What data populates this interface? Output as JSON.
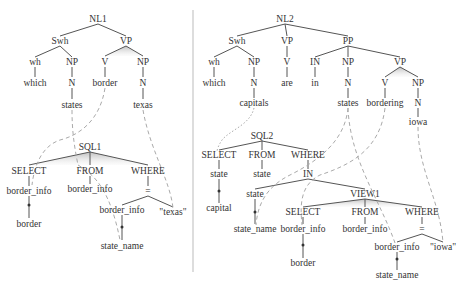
{
  "figure": {
    "left_panel": {
      "title": "NL1",
      "nodes": [
        {
          "id": "NL1",
          "label": "NL1",
          "x": 98,
          "y": 19
        },
        {
          "id": "Swh1",
          "label": "Swh",
          "x": 60,
          "y": 41
        },
        {
          "id": "VP1",
          "label": "VP",
          "x": 126,
          "y": 41
        },
        {
          "id": "wh1",
          "label": "wh",
          "x": 35,
          "y": 62
        },
        {
          "id": "NP1a",
          "label": "NP",
          "x": 72,
          "y": 62
        },
        {
          "id": "V1",
          "label": "V",
          "x": 105,
          "y": 62
        },
        {
          "id": "NP1b",
          "label": "NP",
          "x": 143,
          "y": 62
        },
        {
          "id": "which1",
          "label": "which",
          "x": 35,
          "y": 83
        },
        {
          "id": "N1a",
          "label": "N",
          "x": 72,
          "y": 83
        },
        {
          "id": "border1",
          "label": "border",
          "x": 105,
          "y": 83
        },
        {
          "id": "N1b",
          "label": "N",
          "x": 143,
          "y": 83
        },
        {
          "id": "states1",
          "label": "states",
          "x": 72,
          "y": 106
        },
        {
          "id": "texas1",
          "label": "texas",
          "x": 143,
          "y": 106
        },
        {
          "id": "SQL1",
          "label": "SQL1",
          "x": 88,
          "y": 147
        },
        {
          "id": "SELECT1",
          "label": "SELECT",
          "x": 29,
          "y": 171
        },
        {
          "id": "FROM1",
          "label": "FROM",
          "x": 90,
          "y": 171
        },
        {
          "id": "WHERE1",
          "label": "WHERE",
          "x": 148,
          "y": 171
        },
        {
          "id": "bi1a",
          "label": "border_info",
          "x": 29,
          "y": 192
        },
        {
          "id": "bi1b",
          "label": "border_info",
          "x": 90,
          "y": 190
        },
        {
          "id": "eq1",
          "label": "=",
          "x": 148,
          "y": 192
        },
        {
          "id": "border1s",
          "label": "border",
          "x": 29,
          "y": 225
        },
        {
          "id": "bi1c",
          "label": "border_info",
          "x": 126,
          "y": 211
        },
        {
          "id": "texasq1",
          "label": "\"texas\"",
          "x": 173,
          "y": 213
        },
        {
          "id": "sn1",
          "label": "state_name",
          "x": 122,
          "y": 247
        }
      ]
    },
    "right_panel": {
      "title": "NL2",
      "nodes": [
        {
          "id": "NL2",
          "label": "NL2",
          "x": 285,
          "y": 19
        },
        {
          "id": "Swh2",
          "label": "Swh",
          "x": 237,
          "y": 41
        },
        {
          "id": "VP2a",
          "label": "VP",
          "x": 287,
          "y": 41
        },
        {
          "id": "PP2",
          "label": "PP",
          "x": 348,
          "y": 41
        },
        {
          "id": "wh2",
          "label": "wh",
          "x": 214,
          "y": 62
        },
        {
          "id": "NP2a",
          "label": "NP",
          "x": 254,
          "y": 62
        },
        {
          "id": "V2a",
          "label": "V",
          "x": 287,
          "y": 62
        },
        {
          "id": "IN2",
          "label": "IN",
          "x": 315,
          "y": 62
        },
        {
          "id": "NP2b",
          "label": "NP",
          "x": 348,
          "y": 62
        },
        {
          "id": "VP2b",
          "label": "VP",
          "x": 400,
          "y": 62
        },
        {
          "id": "which2",
          "label": "which",
          "x": 214,
          "y": 83
        },
        {
          "id": "N2a",
          "label": "N",
          "x": 254,
          "y": 83
        },
        {
          "id": "are2",
          "label": "are",
          "x": 287,
          "y": 83
        },
        {
          "id": "in2",
          "label": "in",
          "x": 315,
          "y": 83
        },
        {
          "id": "N2b",
          "label": "N",
          "x": 348,
          "y": 83
        },
        {
          "id": "V2b",
          "label": "V",
          "x": 385,
          "y": 83
        },
        {
          "id": "NP2c",
          "label": "NP",
          "x": 418,
          "y": 83
        },
        {
          "id": "capitals2",
          "label": "capitals",
          "x": 254,
          "y": 104
        },
        {
          "id": "states2",
          "label": "states",
          "x": 348,
          "y": 104
        },
        {
          "id": "bordering2",
          "label": "bordering",
          "x": 385,
          "y": 104
        },
        {
          "id": "N2c",
          "label": "N",
          "x": 418,
          "y": 104
        },
        {
          "id": "iowa2",
          "label": "iowa",
          "x": 418,
          "y": 123
        },
        {
          "id": "SQL2",
          "label": "SQL2",
          "x": 262,
          "y": 136
        },
        {
          "id": "SELECT2",
          "label": "SELECT",
          "x": 219,
          "y": 156
        },
        {
          "id": "FROM2",
          "label": "FROM",
          "x": 262,
          "y": 156
        },
        {
          "id": "WHERE2",
          "label": "WHERE",
          "x": 308,
          "y": 156
        },
        {
          "id": "state2a",
          "label": "state",
          "x": 219,
          "y": 175
        },
        {
          "id": "state2b",
          "label": "state",
          "x": 262,
          "y": 175
        },
        {
          "id": "IN2s",
          "label": "IN",
          "x": 308,
          "y": 175
        },
        {
          "id": "capital2",
          "label": "capital",
          "x": 219,
          "y": 209
        },
        {
          "id": "state2c",
          "label": "state",
          "x": 255,
          "y": 195
        },
        {
          "id": "VIEW1",
          "label": "VIEW1",
          "x": 365,
          "y": 195
        },
        {
          "id": "sn2a",
          "label": "state_name",
          "x": 255,
          "y": 230
        },
        {
          "id": "SELECT3",
          "label": "SELECT",
          "x": 303,
          "y": 213
        },
        {
          "id": "FROM3",
          "label": "FROM",
          "x": 365,
          "y": 213
        },
        {
          "id": "WHERE3",
          "label": "WHERE",
          "x": 422,
          "y": 213
        },
        {
          "id": "bi2a",
          "label": "border_info",
          "x": 303,
          "y": 230
        },
        {
          "id": "bi2b",
          "label": "border_info",
          "x": 365,
          "y": 230
        },
        {
          "id": "eq2",
          "label": "=",
          "x": 422,
          "y": 230
        },
        {
          "id": "border2",
          "label": "border",
          "x": 303,
          "y": 264
        },
        {
          "id": "bi2c",
          "label": "border_info",
          "x": 397,
          "y": 248
        },
        {
          "id": "iowaq2",
          "label": "\"iowa\"",
          "x": 443,
          "y": 248
        },
        {
          "id": "sn2b",
          "label": "state_name",
          "x": 397,
          "y": 276
        }
      ]
    }
  }
}
